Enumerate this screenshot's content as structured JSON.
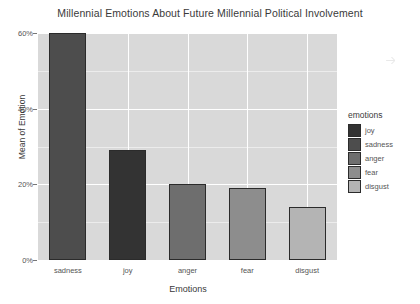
{
  "chart_data": {
    "type": "bar",
    "title": "Millennial Emotions About Future Millennial Political Involvement",
    "xlabel": "Emotions",
    "ylabel": "Mean of Emotion",
    "categories": [
      "sadness",
      "joy",
      "anger",
      "fear",
      "disgust"
    ],
    "values": [
      60,
      29,
      20,
      19,
      14
    ],
    "value_labels": [
      "60%",
      "29%",
      "20%",
      "19%",
      "14%"
    ],
    "ylim": [
      0,
      60
    ],
    "yticks": [
      0,
      20,
      40,
      60
    ],
    "ytick_labels": [
      "0%",
      "20%",
      "40%",
      "60%"
    ],
    "grid": true,
    "grid_color": "#ffffff",
    "panel_background": "#d9d9d9",
    "legend": {
      "position": "right",
      "title": "emotions",
      "entries": [
        {
          "label": "joy",
          "color": "#333333"
        },
        {
          "label": "sadness",
          "color": "#4d4d4d"
        },
        {
          "label": "anger",
          "color": "#6e6e6e"
        },
        {
          "label": "fear",
          "color": "#8d8d8d"
        },
        {
          "label": "disgust",
          "color": "#b4b4b4"
        }
      ]
    },
    "bar_colors": [
      "#4d4d4d",
      "#333333",
      "#6e6e6e",
      "#8d8d8d",
      "#b4b4b4"
    ],
    "bar_border_color": "#2b2b2b"
  }
}
